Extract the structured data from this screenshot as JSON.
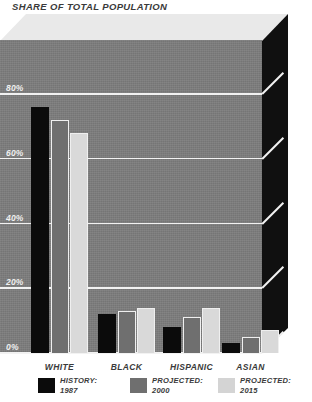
{
  "chart_data": {
    "type": "bar",
    "title": "SHARE OF TOTAL POPULATION",
    "xlabel": "",
    "ylabel": "",
    "ylim": [
      0,
      90
    ],
    "yticks": [
      0,
      20,
      40,
      60,
      80
    ],
    "ytick_labels": [
      "0%",
      "20%",
      "40%",
      "60%",
      "80%"
    ],
    "grid": true,
    "legend_position": "bottom",
    "categories": [
      "WHITE",
      "BLACK",
      "HISPANIC",
      "ASIAN"
    ],
    "series": [
      {
        "name": "HISTORY:",
        "year": "1987",
        "color": "#0b0b0b",
        "values": [
          76,
          12,
          8,
          3
        ]
      },
      {
        "name": "PROJECTED:",
        "year": "2000",
        "color": "#6f6f6f",
        "values": [
          72,
          13,
          11,
          5
        ]
      },
      {
        "name": "PROJECTED:",
        "year": "2015",
        "color": "#d9d9d9",
        "values": [
          68,
          14,
          14,
          7
        ]
      }
    ]
  },
  "colors": {
    "plot_background": "#7c7c7c",
    "right_face": "#101010",
    "top_face": "#e9e9e9",
    "gridline": "#f2f2f2",
    "page_background": "#ffffff",
    "text": "#3a3a3a",
    "axis_text": "#f0f0f0"
  }
}
